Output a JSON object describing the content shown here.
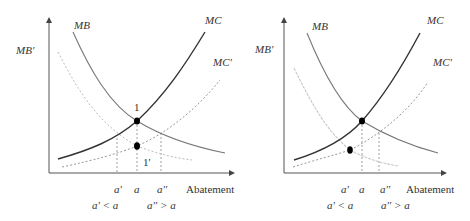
{
  "figure": {
    "panels": [
      {
        "id": "left",
        "y_axis_label": "MB'",
        "x_axis_label": "Abatement",
        "curves": [
          {
            "name": "MB",
            "label": "MB",
            "style": "solid-gray"
          },
          {
            "name": "MC",
            "label": "MC",
            "style": "solid-dark"
          },
          {
            "name": "MB'",
            "label": "MB'",
            "style": "dotted-light"
          },
          {
            "name": "MC'",
            "label": "MC'",
            "style": "dotted"
          }
        ],
        "points": [
          {
            "label": "1"
          },
          {
            "label": "1'"
          }
        ],
        "x_ticks": [
          "a'",
          "a",
          "a''"
        ],
        "x_notes": [
          "a' < a",
          "a'' > a"
        ]
      },
      {
        "id": "right",
        "y_axis_label": "MB'",
        "x_axis_label": "Abatement",
        "curves": [
          {
            "name": "MB",
            "label": "MB",
            "style": "solid-gray"
          },
          {
            "name": "MC",
            "label": "MC",
            "style": "solid-dark"
          },
          {
            "name": "MB'",
            "label": "MB'",
            "style": "dotted-light"
          },
          {
            "name": "MC'",
            "label": "MC'",
            "style": "dotted"
          }
        ],
        "x_ticks": [
          "a'",
          "a",
          "a''"
        ],
        "x_notes": [
          "a' < a",
          "a'' > a"
        ]
      }
    ]
  }
}
